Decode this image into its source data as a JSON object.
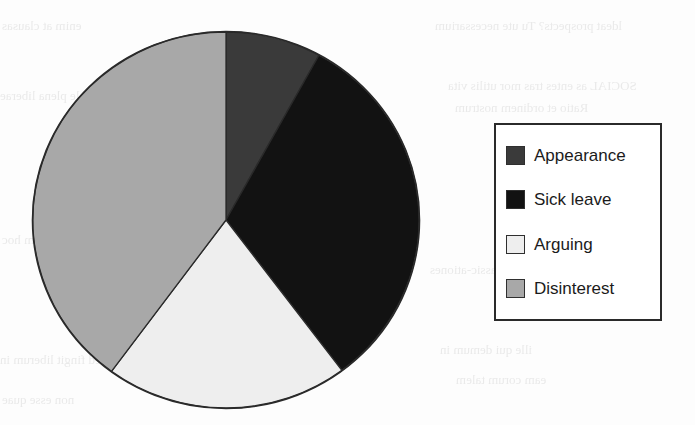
{
  "chart_data": {
    "type": "pie",
    "title": "",
    "subtitle": "",
    "xlabel": "",
    "ylabel": "",
    "grid": false,
    "legend_position": "right",
    "start_angle_deg": 0,
    "direction": "clockwise",
    "categories": [
      "Appearance",
      "Sick leave",
      "Arguing",
      "Disinterest"
    ],
    "values": [
      8,
      32,
      20,
      40
    ],
    "units": "percent",
    "slice_angles_deg": [
      28.8,
      114.3,
      73.3,
      143.6
    ],
    "colors": [
      "#3a3a3a",
      "#121212",
      "#eeeeee",
      "#a8a8a8"
    ],
    "slices": [
      {
        "label": "Appearance",
        "value": 8,
        "angle_deg": 28.8,
        "color": "#3a3a3a",
        "start_deg": 0.0,
        "end_deg": 28.8
      },
      {
        "label": "Sick leave",
        "value": 32,
        "angle_deg": 114.3,
        "color": "#121212",
        "start_deg": 28.8,
        "end_deg": 143.1
      },
      {
        "label": "Arguing",
        "value": 20,
        "angle_deg": 73.3,
        "color": "#eeeeee",
        "start_deg": 143.1,
        "end_deg": 216.4
      },
      {
        "label": "Disinterest",
        "value": 40,
        "angle_deg": 143.6,
        "color": "#a8a8a8",
        "start_deg": 216.4,
        "end_deg": 360.0
      }
    ]
  },
  "legend": {
    "items": [
      {
        "label": "Appearance",
        "color": "#3a3a3a"
      },
      {
        "label": "Sick leave",
        "color": "#121212"
      },
      {
        "label": "Arguing",
        "color": "#eeeeee"
      },
      {
        "label": "Disinterest",
        "color": "#a8a8a8"
      }
    ]
  },
  "style": {
    "page_background": "#fdfdfd",
    "outline_color": "#2a2a2a",
    "text_color": "#1b1b1b"
  },
  "background_artifacts": {
    "note": "faint scanner show-through text from the reverse side of the page",
    "lines": [
      "ldeat prospects? Tu ute necessarium",
      "enim at clausas",
      "SOCIAL as entes tras mor utilis vita",
      "er nam sale plena liberae",
      "Ratio et ordinem nostrum",
      "Classic-ationes",
      "ille qui demum in",
      "nec etiam hoc",
      "Sed fingit liberum in",
      "eam corum talem",
      "non esse quae"
    ]
  }
}
